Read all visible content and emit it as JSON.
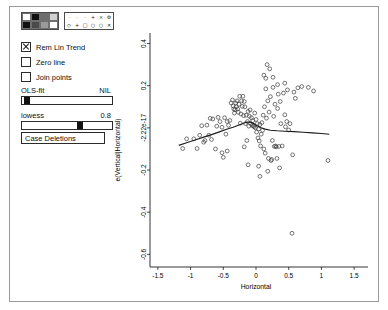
{
  "window": {
    "title": ""
  },
  "controls": {
    "color_palette": {
      "name": "color-palette",
      "swatches": [
        "#ffffff",
        "#111111",
        "#6e6e6e",
        "#d0d0d0",
        "#111111",
        "#4a4a4a",
        "#9a9a9a",
        "#ffffff"
      ]
    },
    "symbol_palette": {
      "name": "symbol-palette",
      "symbols": [
        "·",
        "·",
        "·",
        "+",
        "×",
        "⚙",
        "◇",
        "+",
        "□",
        "○",
        "○",
        "✕"
      ]
    },
    "checkboxes": [
      {
        "label": "Rem Lin Trend",
        "checked": true,
        "name": "rem-lin-trend"
      },
      {
        "label": "Zero line",
        "checked": false,
        "name": "zero-line"
      },
      {
        "label": "Join points",
        "checked": false,
        "name": "join-points"
      }
    ],
    "sliders": [
      {
        "label": "OLS-fit",
        "value_label": "NIL",
        "fraction": 0.02,
        "name": "ols-fit"
      },
      {
        "label": "lowess",
        "value_label": "0.8",
        "fraction": 0.66,
        "name": "lowess"
      }
    ],
    "buttons": [
      {
        "label": "Case Deletions",
        "name": "case-deletions"
      }
    ]
  },
  "chart_data": {
    "type": "scatter",
    "title": "",
    "xlabel": "Horizontal",
    "ylabel": "e(Vertical|Horizontal)",
    "xlim": [
      -1.62,
      1.62
    ],
    "ylim": [
      -0.66,
      0.45
    ],
    "xticks": [
      -1.5,
      -1,
      -0.5,
      0,
      0.5,
      1,
      1.5
    ],
    "xticklabels": [
      "-1.5",
      "-1",
      "-0.5",
      "0",
      "0.5",
      "1",
      "1.5"
    ],
    "yticks": [
      0.4,
      0.2,
      0,
      -0.2,
      -0.4,
      -0.6
    ],
    "yticklabels": [
      "0.4",
      "0.2",
      "-2.22e-17",
      "-0.2",
      "-0.4",
      "-0.6"
    ],
    "grid": false,
    "legend": "none",
    "marker": "open-circle",
    "series": [
      {
        "name": "partial residuals",
        "points": [
          [
            -1.12,
            -0.098
          ],
          [
            -1.06,
            -0.052
          ],
          [
            -0.95,
            -0.052
          ],
          [
            -0.9,
            -0.098
          ],
          [
            -0.86,
            -0.035
          ],
          [
            -0.83,
            0.01
          ],
          [
            -0.8,
            -0.068
          ],
          [
            -0.75,
            0.013
          ],
          [
            -0.72,
            -0.035
          ],
          [
            -0.7,
            0.045
          ],
          [
            -0.66,
            0.042
          ],
          [
            -0.62,
            -0.1
          ],
          [
            -0.6,
            0.008
          ],
          [
            -0.58,
            0.05
          ],
          [
            -0.55,
            0.03
          ],
          [
            -0.52,
            0.003
          ],
          [
            -0.5,
            -0.14
          ],
          [
            -0.48,
            0.048
          ],
          [
            -0.46,
            -0.03
          ],
          [
            -0.44,
            0.03
          ],
          [
            -0.42,
            0.012
          ],
          [
            -0.4,
            0.035
          ],
          [
            -0.38,
            0.118
          ],
          [
            -0.36,
            0.132
          ],
          [
            -0.35,
            0.104
          ],
          [
            -0.34,
            0.09
          ],
          [
            -0.33,
            0.07
          ],
          [
            -0.32,
            0.086
          ],
          [
            -0.31,
            0.118
          ],
          [
            -0.3,
            0.1
          ],
          [
            -0.29,
            0.128
          ],
          [
            -0.28,
            0.09
          ],
          [
            -0.27,
            0.074
          ],
          [
            -0.26,
            0.112
          ],
          [
            -0.25,
            0.15
          ],
          [
            -0.24,
            0.022
          ],
          [
            -0.23,
            0.066
          ],
          [
            -0.22,
            0.128
          ],
          [
            -0.21,
            0.102
          ],
          [
            -0.2,
            0.15
          ],
          [
            -0.19,
            0.058
          ],
          [
            -0.18,
            0.125
          ],
          [
            -0.17,
            0.1
          ],
          [
            -0.16,
            0.02
          ],
          [
            -0.15,
            0.06
          ],
          [
            -0.14,
            -0.06
          ],
          [
            -0.13,
            0.03
          ],
          [
            -0.12,
            0.078
          ],
          [
            -0.11,
            0.008
          ],
          [
            -0.1,
            0.055
          ],
          [
            -0.09,
            0.085
          ],
          [
            -0.08,
            0.02
          ],
          [
            -0.07,
            0.048
          ],
          [
            -0.06,
            0.012
          ],
          [
            -0.05,
            0.034
          ],
          [
            -0.04,
            0.01
          ],
          [
            -0.03,
            0.005
          ],
          [
            -0.02,
            0.07
          ],
          [
            -0.01,
            0.0
          ],
          [
            0.0,
            0.04
          ],
          [
            0.01,
            -0.02
          ],
          [
            0.02,
            0.02
          ],
          [
            0.03,
            -0.048
          ],
          [
            0.04,
            -0.005
          ],
          [
            0.05,
            -0.062
          ],
          [
            0.06,
            0.016
          ],
          [
            0.07,
            -0.086
          ],
          [
            0.08,
            -0.03
          ],
          [
            0.09,
            0.025
          ],
          [
            0.1,
            -0.012
          ],
          [
            0.11,
            0.06
          ],
          [
            0.12,
            -0.1
          ],
          [
            0.13,
            0.1
          ],
          [
            0.14,
            -0.12
          ],
          [
            0.15,
            0.185
          ],
          [
            0.16,
            0.046
          ],
          [
            0.17,
            0.3
          ],
          [
            0.18,
            0.128
          ],
          [
            0.19,
            -0.145
          ],
          [
            0.2,
            0.075
          ],
          [
            0.21,
            0.28
          ],
          [
            0.22,
            0.148
          ],
          [
            0.23,
            -0.155
          ],
          [
            0.24,
            -0.15
          ],
          [
            0.25,
            -0.06
          ],
          [
            0.26,
            0.192
          ],
          [
            0.27,
            0.055
          ],
          [
            0.28,
            -0.088
          ],
          [
            0.29,
            0.112
          ],
          [
            0.3,
            -0.086
          ],
          [
            0.31,
            -0.09
          ],
          [
            0.32,
            -0.145
          ],
          [
            0.33,
            0.092
          ],
          [
            0.34,
            0.16
          ],
          [
            0.35,
            -0.088
          ],
          [
            0.36,
            -0.19
          ],
          [
            0.37,
            0.125
          ],
          [
            0.38,
            0.02
          ],
          [
            0.4,
            -0.086
          ],
          [
            0.42,
            0.165
          ],
          [
            0.44,
            0.062
          ],
          [
            0.45,
            0.005
          ],
          [
            0.47,
            0.03
          ],
          [
            0.48,
            0.18
          ],
          [
            0.5,
            -0.01
          ],
          [
            0.52,
            0.02
          ],
          [
            0.55,
            -0.5
          ],
          [
            0.56,
            -0.128
          ],
          [
            0.58,
            0.17
          ],
          [
            0.6,
            0.14
          ],
          [
            0.64,
            0.19
          ],
          [
            0.7,
            0.196
          ],
          [
            0.8,
            0.192
          ],
          [
            0.88,
            0.175
          ],
          [
            1.1,
            -0.155
          ],
          [
            -0.52,
            -0.118
          ],
          [
            -0.68,
            -0.055
          ],
          [
            -0.78,
            -0.06
          ],
          [
            -0.44,
            -0.11
          ],
          [
            -0.18,
            -0.09
          ],
          [
            -0.12,
            -0.175
          ],
          [
            0.04,
            -0.182
          ],
          [
            0.06,
            -0.23
          ],
          [
            0.18,
            -0.206
          ],
          [
            0.15,
            0.235
          ],
          [
            0.12,
            0.25
          ],
          [
            0.26,
            0.24
          ],
          [
            0.33,
            0.205
          ],
          [
            0.44,
            0.212
          ]
        ]
      }
    ],
    "smoother": {
      "name": "lowess-curve",
      "span": 0.8,
      "points": [
        [
          -1.18,
          -0.083
        ],
        [
          -1.05,
          -0.069
        ],
        [
          -0.92,
          -0.056
        ],
        [
          -0.8,
          -0.044
        ],
        [
          -0.68,
          -0.032
        ],
        [
          -0.56,
          -0.019
        ],
        [
          -0.45,
          -0.007
        ],
        [
          -0.35,
          0.003
        ],
        [
          -0.28,
          0.011
        ],
        [
          -0.22,
          0.018
        ],
        [
          -0.17,
          0.024
        ],
        [
          -0.13,
          0.027
        ],
        [
          -0.09,
          0.027
        ],
        [
          -0.05,
          0.023
        ],
        [
          -0.01,
          0.016
        ],
        [
          0.03,
          0.008
        ],
        [
          0.08,
          0.0
        ],
        [
          0.14,
          -0.006
        ],
        [
          0.22,
          -0.011
        ],
        [
          0.32,
          -0.014
        ],
        [
          0.44,
          -0.016
        ],
        [
          0.58,
          -0.018
        ],
        [
          0.72,
          -0.021
        ],
        [
          0.86,
          -0.024
        ],
        [
          1.0,
          -0.027
        ],
        [
          1.12,
          -0.03
        ]
      ]
    }
  }
}
